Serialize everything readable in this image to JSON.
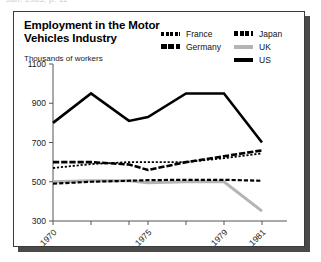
{
  "top_strip_text": "Jan. 1983, p. 11",
  "card": {
    "title": "Employment in the Motor Vehicles Industry",
    "y_caption": "Thousands of workers"
  },
  "legend": {
    "column_1": [
      {
        "label": "France",
        "swatch": "dotted-thin-black",
        "color": "#000000"
      },
      {
        "label": "Germany",
        "swatch": "dashed-thick-black",
        "color": "#000000"
      }
    ],
    "column_2": [
      {
        "label": "Japan",
        "swatch": "dashed-black",
        "color": "#000000"
      },
      {
        "label": "UK",
        "swatch": "solid-gray",
        "color": "#b4b4b4"
      },
      {
        "label": "US",
        "swatch": "solid-black",
        "color": "#000000"
      }
    ]
  },
  "chart_data": {
    "type": "line",
    "title": "Employment in the Motor Vehicles Industry",
    "subtitle": "Thousands of workers",
    "xlabel": "",
    "ylabel": "Thousands of workers",
    "ylim": [
      300,
      1100
    ],
    "ytick_labels": [
      "1100",
      "900",
      "700",
      "500",
      "300"
    ],
    "yticks": [
      1100,
      900,
      700,
      500,
      300
    ],
    "xlim": [
      1970,
      1982
    ],
    "x": [
      1970,
      1972,
      1974,
      1975,
      1977,
      1979,
      1981
    ],
    "xtick_labels": [
      "1970",
      "",
      "",
      "1975",
      "",
      "1979",
      "1981"
    ],
    "xticks": [
      1970,
      1972,
      1974,
      1975,
      1977,
      1979,
      1981
    ],
    "grid": false,
    "legend_position": "top-right",
    "series": [
      {
        "name": "US",
        "color": "#000000",
        "style": "solid",
        "width": 2.6,
        "values": [
          800,
          950,
          810,
          830,
          950,
          950,
          700
        ]
      },
      {
        "name": "Germany",
        "color": "#000000",
        "style": "dashed-thick",
        "width": 2.6,
        "values": [
          600,
          600,
          588,
          560,
          600,
          630,
          660
        ]
      },
      {
        "name": "France",
        "color": "#000000",
        "style": "dotted-thin",
        "width": 1.8,
        "values": [
          570,
          590,
          600,
          600,
          600,
          620,
          645
        ]
      },
      {
        "name": "Japan",
        "color": "#000000",
        "style": "dashed",
        "width": 2.2,
        "values": [
          490,
          500,
          505,
          508,
          510,
          510,
          505
        ]
      },
      {
        "name": "UK",
        "color": "#b4b4b4",
        "style": "solid",
        "width": 3.0,
        "values": [
          500,
          505,
          505,
          495,
          500,
          500,
          350
        ]
      }
    ]
  }
}
